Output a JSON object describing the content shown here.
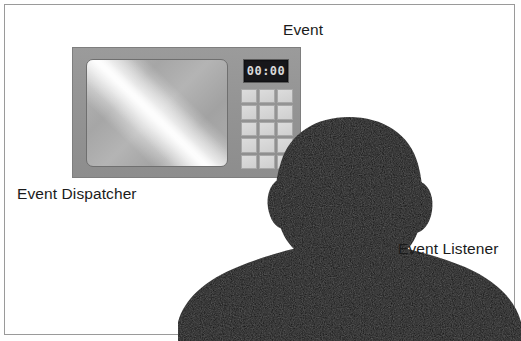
{
  "diagram": {
    "background_color": "#ffffff",
    "border_color": "#9a9a9a",
    "labels": {
      "event": "Event",
      "dispatcher": "Event Dispatcher",
      "listener": "Event Listener"
    }
  },
  "dispatcher": {
    "kind": "microwave-oven",
    "body_color": "#949494",
    "screen": {
      "kind": "oven-door-window",
      "highlight": "diagonal-glare"
    },
    "clock": {
      "display_value": "00:00",
      "display_color": "#d9d9d9",
      "panel_color": "#17171a"
    },
    "keypad": {
      "columns": 3,
      "rows": 5,
      "button_count": 15,
      "button_color": "#d6d6d6",
      "buttons": [
        "",
        "",
        "",
        "",
        "",
        "",
        "",
        "",
        "",
        "",
        "",
        "",
        "",
        "",
        ""
      ]
    }
  },
  "listener": {
    "kind": "person-silhouette",
    "color": "#0d0d0d",
    "orientation": "back-of-head-facing-dispatcher"
  }
}
